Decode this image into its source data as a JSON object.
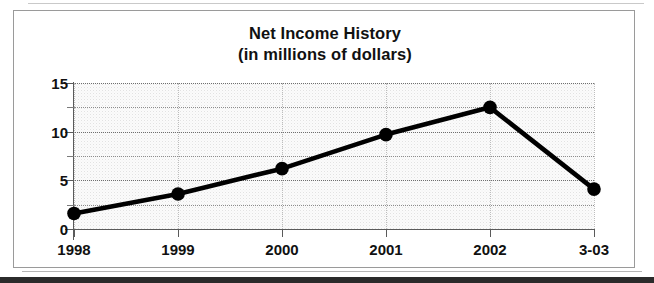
{
  "figure": {
    "title": "Net Income History",
    "subtitle": "(in millions of dollars)"
  },
  "chart_data": {
    "type": "line",
    "title": "Net Income History",
    "subtitle": "(in millions of dollars)",
    "xlabel": "",
    "ylabel": "",
    "units": "millions of dollars",
    "categories": [
      "1998",
      "1999",
      "2000",
      "2001",
      "2002",
      "3-03"
    ],
    "values": [
      1.6,
      3.6,
      6.2,
      9.7,
      12.5,
      4.1
    ],
    "series": [
      {
        "name": "Net Income",
        "values": [
          1.6,
          3.6,
          6.2,
          9.7,
          12.5,
          4.1
        ]
      }
    ],
    "ylim": [
      0,
      15
    ],
    "ytick_labels": [
      "0",
      "5",
      "10",
      "15"
    ],
    "ytick_values": [
      0,
      5,
      10,
      15
    ],
    "yminor_values": [
      2.5,
      7.5,
      12.5
    ],
    "grid": true,
    "legend": false,
    "marker": "filled-circle",
    "line_color": "#000000",
    "marker_color": "#000000",
    "plot_background": "#f7f7f7"
  }
}
